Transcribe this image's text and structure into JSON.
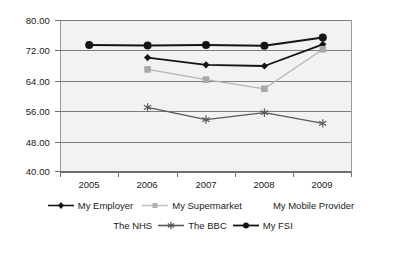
{
  "chart_data": {
    "type": "line",
    "title": "",
    "xlabel": "",
    "ylabel": "",
    "categories": [
      "2005",
      "2006",
      "2007",
      "2008",
      "2009"
    ],
    "x": [
      2005,
      2006,
      2007,
      2008,
      2009
    ],
    "ylim": [
      40.0,
      80.0
    ],
    "y_ticks": [
      40.0,
      48.0,
      56.0,
      64.0,
      72.0,
      80.0
    ],
    "y_tick_labels": [
      "40.00",
      "48.00",
      "56.00",
      "64.00",
      "72.00",
      "80.00"
    ],
    "grid": true,
    "legend_position": "bottom",
    "series": [
      {
        "name": "My Employer",
        "marker": "diamond",
        "color": "#141414",
        "values": [
          null,
          70.1,
          68.2,
          67.9,
          73.6
        ]
      },
      {
        "name": "My Supermarket",
        "marker": "square",
        "color": "#b4b4b4",
        "values": [
          null,
          67.0,
          64.3,
          61.9,
          72.3
        ]
      },
      {
        "name": "My Mobile Provider",
        "marker": "none",
        "color": "#d8d8d8",
        "values": [
          null,
          null,
          null,
          null,
          null
        ]
      },
      {
        "name": "The NHS",
        "marker": "none",
        "color": "#d8d8d8",
        "values": [
          null,
          null,
          null,
          null,
          null
        ]
      },
      {
        "name": "The BBC",
        "marker": "asterisk",
        "color": "#585858",
        "values": [
          null,
          57.0,
          53.8,
          55.6,
          52.8
        ]
      },
      {
        "name": "My FSI",
        "marker": "circle",
        "color": "#141414",
        "values": [
          73.4,
          73.3,
          73.4,
          73.2,
          75.4
        ]
      }
    ]
  },
  "legend": {
    "row1": [
      {
        "label": "My Employer",
        "key": "diamond-line-key"
      },
      {
        "label": "My Supermarket",
        "key": "square-line-key"
      },
      {
        "label": "My Mobile Provider",
        "key": "no-key"
      }
    ],
    "row2": [
      {
        "label": "The NHS",
        "key": "no-key"
      },
      {
        "label": "The BBC",
        "key": "asterisk-line-key"
      },
      {
        "label": "My FSI",
        "key": "circle-line-key"
      }
    ]
  },
  "colors": {
    "plot_background": "#f2f2f2",
    "gridline": "#7d7d7d",
    "axis": "#6e6e6e",
    "dark_series": "#141414",
    "mid_series": "#585858",
    "light_series": "#b4b4b4"
  }
}
